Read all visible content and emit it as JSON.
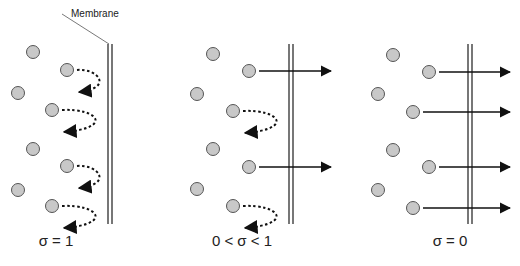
{
  "membrane_label": "Membrane",
  "colors": {
    "particle_fill": "#c8c8c8",
    "particle_stroke": "#555555",
    "membrane": "#555555",
    "arrow": "#111111"
  },
  "panels": [
    {
      "caption": "σ = 1",
      "caption_x": 56,
      "membrane_x": 110,
      "particles": [
        [
          33,
          52
        ],
        [
          67,
          70
        ],
        [
          18,
          93
        ],
        [
          52,
          110
        ],
        [
          33,
          149
        ],
        [
          67,
          166
        ],
        [
          18,
          190
        ],
        [
          52,
          206
        ]
      ],
      "flows": [
        {
          "from": [
            67,
            70
          ],
          "type": "reflected"
        },
        {
          "from": [
            52,
            110
          ],
          "type": "reflected"
        },
        {
          "from": [
            67,
            166
          ],
          "type": "reflected"
        },
        {
          "from": [
            52,
            206
          ],
          "type": "reflected"
        }
      ]
    },
    {
      "caption": "0 < σ < 1",
      "caption_x": 242,
      "membrane_x": 291,
      "particles": [
        [
          213,
          54
        ],
        [
          249,
          71
        ],
        [
          197,
          94
        ],
        [
          233,
          111
        ],
        [
          213,
          149
        ],
        [
          249,
          167
        ],
        [
          197,
          189
        ],
        [
          233,
          206
        ]
      ],
      "flows": [
        {
          "from": [
            249,
            71
          ],
          "type": "passed"
        },
        {
          "from": [
            233,
            111
          ],
          "type": "reflected"
        },
        {
          "from": [
            249,
            167
          ],
          "type": "passed"
        },
        {
          "from": [
            233,
            206
          ],
          "type": "reflected"
        }
      ]
    },
    {
      "caption": "σ = 0",
      "caption_x": 450,
      "membrane_x": 470,
      "particles": [
        [
          393,
          55
        ],
        [
          429,
          72
        ],
        [
          378,
          94
        ],
        [
          413,
          112
        ],
        [
          393,
          150
        ],
        [
          429,
          167
        ],
        [
          378,
          190
        ],
        [
          413,
          208
        ]
      ],
      "flows": [
        {
          "from": [
            429,
            72
          ],
          "type": "passed"
        },
        {
          "from": [
            413,
            112
          ],
          "type": "passed"
        },
        {
          "from": [
            429,
            167
          ],
          "type": "passed"
        },
        {
          "from": [
            413,
            208
          ],
          "type": "passed"
        }
      ]
    }
  ]
}
